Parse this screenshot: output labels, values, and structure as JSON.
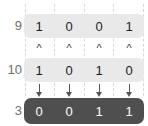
{
  "diagram": {
    "colors": {
      "operand_row_bg": "#e9e9e9",
      "operand_digit": "#1d1d1d",
      "result_row_bg": "#4f4f4f",
      "result_digit": "#ffffff",
      "label_text": "#6e6e6e",
      "operator_text": "#3a3a3a",
      "arrow": "#555555",
      "guide_line": "#d8d8d8",
      "background": "#ffffff"
    },
    "operand_rows": [
      {
        "label": "9",
        "bits": [
          "1",
          "0",
          "0",
          "1"
        ]
      },
      {
        "label": "10",
        "bits": [
          "1",
          "0",
          "1",
          "0"
        ]
      }
    ],
    "operators": [
      "^",
      "^",
      "^",
      "^"
    ],
    "arrows": [
      "down-arrow-icon",
      "down-arrow-icon",
      "down-arrow-icon",
      "down-arrow-icon"
    ],
    "result_row": {
      "label": "3",
      "bits": [
        "0",
        "0",
        "1",
        "1"
      ]
    }
  }
}
